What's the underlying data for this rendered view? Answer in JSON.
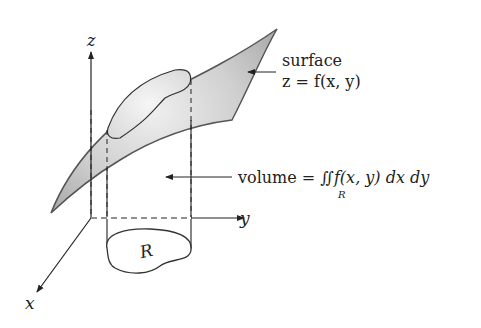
{
  "diagram": {
    "axes": {
      "z_label": "z",
      "y_label": "y",
      "x_label": "x"
    },
    "surface_label": {
      "line1": "surface",
      "line2": "z = f(x, y)"
    },
    "volume_label": {
      "prefix": "volume = ",
      "integral": "∬",
      "region_subscript": "R",
      "integrand": "f(x, y) dx dy"
    },
    "region_label": "R",
    "colors": {
      "surface_fill": "#bdbdbd",
      "surface_highlight": "#ececec",
      "stroke": "#333333",
      "background": "#ffffff"
    }
  }
}
